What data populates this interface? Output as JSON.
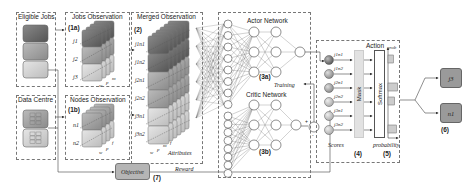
{
  "panels": {
    "eligible_jobs": {
      "title": "Eligible Jobs"
    },
    "data_centre": {
      "title": "Data Centre"
    },
    "jobs_observation": {
      "title": "Jobs Observation",
      "step": "(1a)",
      "rows": [
        "j1",
        "j2",
        "j3"
      ],
      "axes": [
        "m",
        "p",
        "w"
      ]
    },
    "nodes_observation": {
      "title": "Nodes Observation",
      "step": "(1b)",
      "rows": [
        "n1",
        "n2"
      ],
      "axes": [
        "f",
        "p",
        "w"
      ]
    },
    "merged_observation": {
      "title": "Merged Observation",
      "step": "(2)",
      "rows": [
        "j1n1",
        "j1n2",
        "j2n1",
        "j2n2",
        "j3n1",
        "j3n2"
      ],
      "axis_label": "Attributes",
      "axes": [
        "w",
        "p",
        "m",
        "f"
      ]
    },
    "actor_network": {
      "title": "Actor Network",
      "step": "(3a)"
    },
    "critic_network": {
      "title": "Critic Network",
      "step": "(3b)"
    },
    "training": {
      "label": "Training"
    },
    "action": {
      "title": "Action",
      "scores_label": "Scores",
      "scores": [
        "j1n1",
        "j1n2",
        "j2n1",
        "j2n2",
        "j3n1",
        "j3n2"
      ],
      "mask_label": "Mask",
      "mask_step": "(4)",
      "softmax_label": "Softmax",
      "prob_axis": "probability",
      "prob_y": "prob",
      "prob_step": "(5)",
      "bars": [
        0.45,
        0,
        0.8,
        0.55,
        0,
        0.7
      ]
    },
    "output": {
      "job": "j3",
      "node": "n1",
      "step": "(6)"
    },
    "objective": {
      "label": "Objective",
      "step": "(7)",
      "reward_label": "Reward"
    }
  },
  "colors": {
    "dark": "#6e6e6e",
    "mid": "#a0a0a0",
    "light": "#cfcfcf",
    "lighter": "#e4e4e4",
    "box_fill": "#9a9a9a",
    "line": "#444444"
  }
}
